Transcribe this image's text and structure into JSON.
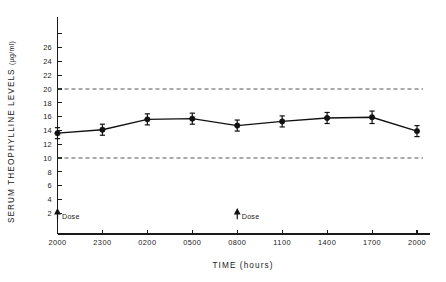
{
  "chart_data": {
    "type": "line",
    "title": "",
    "subtitle": "",
    "xlabel": "TIME (hours)",
    "ylabel": "SERUM THEOPHYLLINE LEVELS (µg/ml)",
    "ylabel_main": "SERUM THEOPHYLLINE LEVELS",
    "ylabel_units": "(µg/ml)",
    "categories": [
      "2000",
      "2300",
      "0200",
      "0500",
      "0800",
      "1100",
      "1400",
      "1700",
      "2000"
    ],
    "values": [
      13.6,
      14.1,
      15.6,
      15.7,
      14.7,
      15.3,
      15.8,
      15.9,
      13.9
    ],
    "errors": [
      0.8,
      0.8,
      0.8,
      0.8,
      0.8,
      0.8,
      0.8,
      0.9,
      0.8
    ],
    "ylim": [
      0,
      28
    ],
    "xlim": [
      0,
      8
    ],
    "yticks": [
      2,
      4,
      6,
      8,
      10,
      12,
      14,
      16,
      18,
      20,
      22,
      24,
      26
    ],
    "ytick_labels": [
      "2",
      "4",
      "6",
      "8",
      "10",
      "12",
      "14",
      "16",
      "18",
      "20",
      "22",
      "24",
      "26"
    ],
    "ytick_unlabeled": [
      28
    ],
    "xtick_labels": [
      "2000",
      "2300",
      "0200",
      "0500",
      "0800",
      "1100",
      "1400",
      "1700",
      "2000"
    ],
    "grid": false,
    "legend": null,
    "legend_position": "none",
    "marker": "filled-circle",
    "error_bar_style": "capped-vertical",
    "reference_lines": [
      {
        "name": "therapeutic-upper",
        "value": 20,
        "style": "dashed",
        "color": "#555555"
      },
      {
        "name": "therapeutic-lower",
        "value": 10,
        "style": "dashed",
        "color": "#555555"
      }
    ],
    "annotations": [
      {
        "name": "dose-annotation-1",
        "label": "Dose",
        "x_category": "2000",
        "x_index": 0,
        "y": 2.0,
        "marker": "up-arrow"
      },
      {
        "name": "dose-annotation-2",
        "label": "Dose",
        "x_category": "0800",
        "x_index": 4,
        "y": 2.0,
        "marker": "up-arrow"
      }
    ],
    "colors": {
      "line": "#111111",
      "marker": "#111111",
      "axis": "#1a1a1a",
      "reference_line": "#555555",
      "background": "#ffffff"
    }
  }
}
